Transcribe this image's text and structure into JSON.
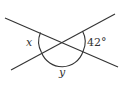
{
  "diagram": {
    "type": "intersecting-lines-angles",
    "labels": {
      "left_angle": "x",
      "right_angle": "42°",
      "bottom_angle": "y"
    },
    "colors": {
      "stroke": "#333333",
      "background": "#ffffff"
    }
  }
}
